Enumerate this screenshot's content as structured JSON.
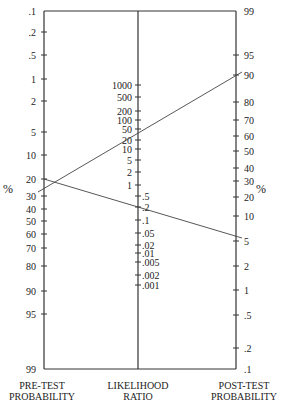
{
  "axes": {
    "left": {
      "label_line1": "PRE-TEST",
      "label_line2": "PROBABILITY",
      "unit": "%",
      "ticks": [
        {
          "v": ".1",
          "y": 11
        },
        {
          "v": ".2",
          "y": 32
        },
        {
          "v": ".5",
          "y": 55
        },
        {
          "v": "1",
          "y": 79
        },
        {
          "v": "2",
          "y": 101
        },
        {
          "v": "5",
          "y": 132
        },
        {
          "v": "10",
          "y": 155
        },
        {
          "v": "20",
          "y": 179
        },
        {
          "v": "30",
          "y": 196
        },
        {
          "v": "40",
          "y": 209
        },
        {
          "v": "50",
          "y": 221
        },
        {
          "v": "60",
          "y": 234
        },
        {
          "v": "70",
          "y": 248
        },
        {
          "v": "80",
          "y": 266
        },
        {
          "v": "90",
          "y": 291
        },
        {
          "v": "95",
          "y": 314
        },
        {
          "v": "99",
          "y": 369
        }
      ]
    },
    "center": {
      "label_line1": "LIKELIHOOD",
      "label_line2": "RATIO",
      "ticks_left": [
        {
          "v": "1000",
          "y": 85
        },
        {
          "v": "500",
          "y": 97
        },
        {
          "v": "200",
          "y": 111
        },
        {
          "v": "100",
          "y": 120
        },
        {
          "v": "50",
          "y": 129
        },
        {
          "v": "20",
          "y": 140
        },
        {
          "v": "10",
          "y": 149
        },
        {
          "v": "5",
          "y": 160
        },
        {
          "v": "2",
          "y": 172
        },
        {
          "v": "1",
          "y": 185
        }
      ],
      "ticks_right": [
        {
          "v": ".5",
          "y": 196
        },
        {
          "v": ".2",
          "y": 207
        },
        {
          "v": ".1",
          "y": 220
        },
        {
          "v": ".05",
          "y": 233
        },
        {
          "v": ".02",
          "y": 245
        },
        {
          "v": ".01",
          "y": 253
        },
        {
          "v": ".005",
          "y": 262
        },
        {
          "v": ".002",
          "y": 275
        },
        {
          "v": ".001",
          "y": 285
        }
      ]
    },
    "right": {
      "label_line1": "POST-TEST",
      "label_line2": "PROBABILITY",
      "unit": "%",
      "ticks": [
        {
          "v": "99",
          "y": 11
        },
        {
          "v": "95",
          "y": 55
        },
        {
          "v": "90",
          "y": 75
        },
        {
          "v": "80",
          "y": 102
        },
        {
          "v": "70",
          "y": 120
        },
        {
          "v": "60",
          "y": 136
        },
        {
          "v": "50",
          "y": 151
        },
        {
          "v": "40",
          "y": 168
        },
        {
          "v": "30",
          "y": 181
        },
        {
          "v": "20",
          "y": 197
        },
        {
          "v": "10",
          "y": 216
        },
        {
          "v": "5",
          "y": 241
        },
        {
          "v": "2",
          "y": 266
        },
        {
          "v": "1",
          "y": 290
        },
        {
          "v": ".5",
          "y": 315
        },
        {
          "v": ".2",
          "y": 348
        },
        {
          "v": ".1",
          "y": 369
        }
      ]
    }
  },
  "lines": [
    {
      "name": "positive-test-line",
      "pre_test": "~28%",
      "post_test": "~90%",
      "x1": 38,
      "y1": 192,
      "x2": 242,
      "y2": 72
    },
    {
      "name": "negative-test-line",
      "pre_test": "20%",
      "post_test": "~6%",
      "x1": 44,
      "y1": 179,
      "x2": 242,
      "y2": 238
    }
  ]
}
